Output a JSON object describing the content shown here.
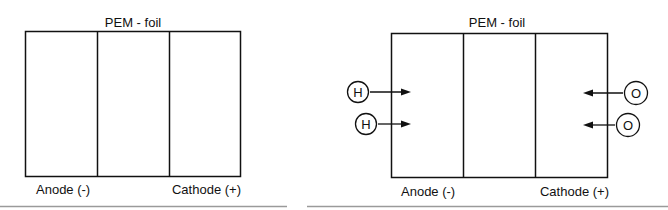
{
  "panels": [
    {
      "name": "panel-without-gases",
      "title": "PEM - foil",
      "anode_label": "Anode (-)",
      "cathode_label": "Cathode (+)",
      "anode_inputs": [],
      "cathode_inputs": []
    },
    {
      "name": "panel-with-gases",
      "title": "PEM - foil",
      "anode_label": "Anode (-)",
      "cathode_label": "Cathode (+)",
      "anode_inputs": [
        "H",
        "H"
      ],
      "cathode_inputs": [
        "O",
        "O"
      ]
    }
  ],
  "colors": {
    "stroke": "#111111",
    "separator": "#9a9a9a"
  }
}
